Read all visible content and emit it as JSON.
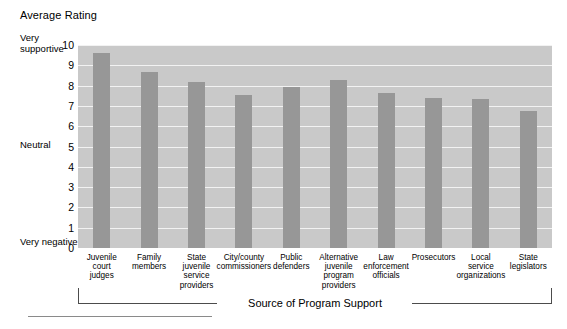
{
  "chart_data": {
    "type": "bar",
    "title": "Average Rating",
    "xlabel": "Source of Program Support",
    "ylabel": "Average Rating",
    "ylim": [
      0,
      10
    ],
    "grid": true,
    "legend": "none",
    "yticks": [
      "10",
      "9",
      "8",
      "7",
      "6",
      "5",
      "4",
      "3",
      "2",
      "1",
      "0"
    ],
    "y_annotations": [
      {
        "value": 10,
        "label": "Very supportive"
      },
      {
        "value": 5,
        "label": "Neutral"
      },
      {
        "value": 0,
        "label": "Very negative"
      }
    ],
    "categories": [
      "Juvenile court judges",
      "Family members",
      "State juvenile service providers",
      "City/county commissioners",
      "Public defenders",
      "Alternative juvenile program providers",
      "Law enforcement officials",
      "Prosecutors",
      "Local service organizations",
      "State legislators"
    ],
    "category_lines": [
      [
        "Juvenile",
        "court",
        "judges"
      ],
      [
        "Family",
        "members"
      ],
      [
        "State",
        "juvenile",
        "service",
        "providers"
      ],
      [
        "City/county",
        "commissioners"
      ],
      [
        "Public",
        "defenders"
      ],
      [
        "Alternative",
        "juvenile",
        "program",
        "providers"
      ],
      [
        "Law",
        "enforcement",
        "officials"
      ],
      [
        "Prosecutors"
      ],
      [
        "Local",
        "service",
        "organizations"
      ],
      [
        "State",
        "legislators"
      ]
    ],
    "values": [
      9.6,
      8.65,
      8.2,
      7.55,
      7.95,
      8.3,
      7.65,
      7.4,
      7.35,
      6.75
    ]
  },
  "colors": {
    "plot_background": "#c9c9c9",
    "bar_fill": "#979797",
    "gridline": "#f2f2f2",
    "text": "#000000",
    "bracket": "#4c4c4c",
    "page_background": "#ffffff"
  }
}
